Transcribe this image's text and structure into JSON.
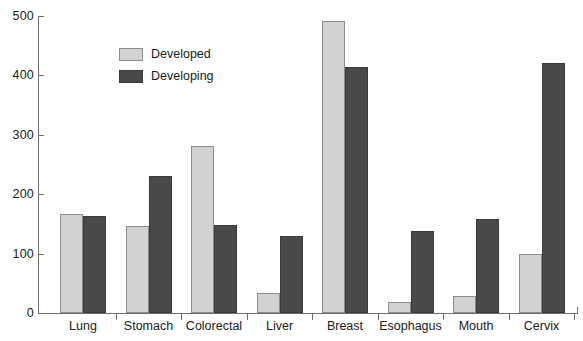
{
  "chart_data": {
    "type": "bar",
    "title": "",
    "subtitle": "",
    "xlabel": "",
    "ylabel": "",
    "ylim": [
      0,
      500
    ],
    "yticks": [
      0,
      100,
      200,
      300,
      400,
      500
    ],
    "grid": false,
    "legend_position": "top-left-inside",
    "categories": [
      "Lung",
      "Stomach",
      "Colorectal",
      "Liver",
      "Breast",
      "Esophagus",
      "Mouth",
      "Cervix"
    ],
    "series": [
      {
        "name": "Developed",
        "color": "#d2d2d2",
        "values": [
          166,
          146,
          281,
          34,
          491,
          18,
          29,
          100
        ]
      },
      {
        "name": "Developing",
        "color": "#494949",
        "values": [
          163,
          230,
          148,
          130,
          414,
          138,
          158,
          421
        ]
      }
    ]
  },
  "legend": {
    "items": [
      {
        "label": "Developed",
        "swatch": "legend-swatch-developed"
      },
      {
        "label": "Developing",
        "swatch": "legend-swatch-developing"
      }
    ]
  },
  "axis": {
    "y_tick_labels": [
      "500",
      "400",
      "300",
      "200",
      "100",
      "0"
    ]
  }
}
